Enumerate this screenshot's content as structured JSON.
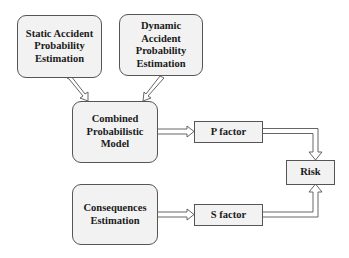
{
  "diagram": {
    "nodes": {
      "static": "Static Accident Probability Estimation",
      "dynamic": "Dynamic Accident Probability Estimation",
      "combined": "Combined Probabilistic Model",
      "consequences": "Consequences Estimation",
      "p_factor": "P factor",
      "s_factor": "S factor",
      "risk": "Risk"
    },
    "edges": [
      {
        "from": "static",
        "to": "combined"
      },
      {
        "from": "dynamic",
        "to": "combined"
      },
      {
        "from": "combined",
        "to": "p_factor"
      },
      {
        "from": "consequences",
        "to": "s_factor"
      },
      {
        "from": "p_factor",
        "to": "risk"
      },
      {
        "from": "s_factor",
        "to": "risk"
      }
    ],
    "colors": {
      "box_fill": "#f2f2f2",
      "border": "#555555",
      "text": "#1a1a1a"
    }
  }
}
